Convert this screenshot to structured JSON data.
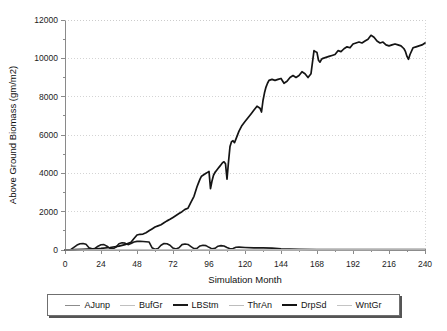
{
  "chart_data": {
    "type": "line",
    "title": "",
    "xlabel": "Simulation Month",
    "ylabel": "Above Ground Biomass (gm/m2)",
    "xlim": [
      0,
      240
    ],
    "ylim": [
      0,
      12000
    ],
    "xticks": [
      0,
      24,
      48,
      72,
      96,
      120,
      144,
      168,
      192,
      216,
      240
    ],
    "xtick_labels": [
      "0",
      "24",
      "48",
      "72",
      "96",
      "120",
      "144",
      "168",
      "192",
      "216",
      "240"
    ],
    "yticks": [
      0,
      2000,
      4000,
      6000,
      8000,
      10000,
      12000
    ],
    "ytick_labels": [
      "0",
      "2000",
      "4000",
      "6000",
      "8000",
      "10000",
      "12000"
    ],
    "yminor_ticks": [
      1000,
      3000,
      5000,
      7000,
      9000,
      11000
    ],
    "grid": "horizontal-dotted",
    "legend_position": "below-outside",
    "series": [
      {
        "name": "AJunp",
        "color": "#8c8c8c",
        "width": 1,
        "x": [
          0,
          6,
          12,
          18,
          24,
          30,
          36,
          42,
          48,
          54,
          60,
          66,
          72,
          78,
          84,
          90,
          96,
          102,
          108,
          114,
          120,
          126,
          132,
          138,
          144,
          150,
          156,
          162,
          168,
          174,
          180,
          186,
          192,
          198,
          204,
          210,
          216,
          222,
          228,
          234,
          240
        ],
        "values": [
          0,
          10,
          20,
          25,
          20,
          15,
          20,
          25,
          30,
          25,
          20,
          20,
          25,
          25,
          20,
          20,
          25,
          20,
          20,
          20,
          20,
          20,
          15,
          15,
          15,
          15,
          15,
          15,
          15,
          15,
          15,
          15,
          15,
          15,
          15,
          15,
          15,
          15,
          15,
          15,
          15
        ]
      },
      {
        "name": "BufGr",
        "color": "#c0c0c0",
        "width": 1,
        "x": [
          0,
          12,
          24,
          36,
          48,
          60,
          72,
          84,
          96,
          108,
          120,
          132,
          144,
          156,
          168,
          180,
          192,
          204,
          216,
          228,
          240
        ],
        "values": [
          0,
          15,
          25,
          20,
          25,
          20,
          20,
          20,
          20,
          15,
          15,
          15,
          10,
          10,
          10,
          10,
          10,
          10,
          10,
          10,
          10
        ]
      },
      {
        "name": "LBStm",
        "color": "#1a1a1a",
        "width": 1.6,
        "x": [
          0,
          4,
          8,
          10,
          12,
          14,
          16,
          18,
          20,
          22,
          24,
          26,
          28,
          30,
          32,
          34,
          36,
          38,
          40,
          42,
          44,
          46,
          48,
          50,
          52,
          54,
          56,
          58,
          60,
          62,
          64,
          66,
          68,
          70,
          72,
          74,
          76,
          78,
          80,
          82,
          84,
          86,
          88,
          90,
          92,
          94,
          96,
          98,
          100,
          102,
          104,
          106,
          108,
          110,
          112,
          114,
          116,
          120,
          126,
          132,
          138,
          144,
          156,
          168,
          180,
          192,
          204,
          216,
          228,
          240
        ],
        "values": [
          0,
          30,
          260,
          330,
          340,
          300,
          120,
          60,
          80,
          200,
          270,
          280,
          200,
          90,
          60,
          150,
          330,
          380,
          360,
          280,
          340,
          420,
          450,
          450,
          440,
          430,
          420,
          120,
          40,
          80,
          250,
          340,
          330,
          250,
          100,
          50,
          120,
          280,
          310,
          290,
          180,
          70,
          90,
          210,
          250,
          230,
          140,
          60,
          90,
          200,
          230,
          210,
          130,
          60,
          80,
          140,
          150,
          130,
          110,
          110,
          100,
          60,
          40,
          30,
          25,
          25,
          25,
          20,
          20,
          20
        ]
      },
      {
        "name": "ThrAn",
        "color": "#bdbdbd",
        "width": 1,
        "x": [
          0,
          12,
          24,
          36,
          48,
          60,
          72,
          84,
          96,
          108,
          120,
          132,
          144,
          156,
          168,
          180,
          192,
          204,
          216,
          228,
          240
        ],
        "values": [
          0,
          20,
          20,
          20,
          20,
          20,
          20,
          15,
          15,
          15,
          10,
          10,
          10,
          10,
          10,
          10,
          10,
          10,
          10,
          10,
          10
        ]
      },
      {
        "name": "DrpSd",
        "color": "#141414",
        "width": 1.7,
        "x": [
          0,
          6,
          12,
          18,
          24,
          30,
          36,
          40,
          44,
          46,
          48,
          50,
          52,
          54,
          56,
          58,
          60,
          62,
          64,
          66,
          68,
          70,
          72,
          74,
          76,
          78,
          80,
          82,
          84,
          86,
          88,
          89,
          90,
          91,
          92,
          93,
          94,
          95,
          96,
          97,
          98,
          99,
          100,
          101,
          102,
          103,
          104,
          105,
          106,
          107,
          108,
          109,
          110,
          111,
          112,
          113,
          114,
          116,
          118,
          120,
          122,
          124,
          126,
          128,
          130,
          131,
          132,
          133,
          134,
          135,
          136,
          138,
          140,
          142,
          144,
          146,
          148,
          150,
          152,
          154,
          156,
          158,
          160,
          162,
          164,
          165,
          166,
          167,
          168,
          169,
          170,
          171,
          172,
          174,
          176,
          178,
          180,
          182,
          184,
          186,
          188,
          190,
          192,
          194,
          196,
          198,
          200,
          202,
          204,
          206,
          208,
          210,
          212,
          214,
          216,
          218,
          220,
          222,
          224,
          226,
          227,
          228,
          229,
          230,
          232,
          234,
          236,
          238,
          240
        ],
        "values": [
          0,
          20,
          40,
          60,
          90,
          130,
          200,
          280,
          400,
          600,
          780,
          820,
          830,
          900,
          1000,
          1100,
          1200,
          1260,
          1320,
          1420,
          1520,
          1600,
          1700,
          1800,
          1900,
          2000,
          2120,
          2180,
          2500,
          2800,
          3300,
          3500,
          3700,
          3850,
          3900,
          3950,
          4000,
          4050,
          4100,
          3200,
          3600,
          3900,
          4050,
          4150,
          4250,
          4350,
          4450,
          4550,
          4600,
          4500,
          3700,
          4600,
          5400,
          5650,
          5700,
          5600,
          5800,
          6200,
          6500,
          6700,
          6900,
          7100,
          7300,
          7500,
          7400,
          7200,
          7800,
          8200,
          8500,
          8700,
          8850,
          8900,
          8850,
          8900,
          8950,
          8700,
          8800,
          9000,
          9100,
          9000,
          9100,
          9300,
          9200,
          9000,
          9200,
          9800,
          10400,
          10350,
          10300,
          9900,
          9800,
          9950,
          10000,
          10050,
          10100,
          10150,
          10200,
          10400,
          10350,
          10500,
          10600,
          10550,
          10750,
          10800,
          10850,
          10800,
          10900,
          11000,
          11200,
          11100,
          10900,
          10800,
          10850,
          10700,
          10650,
          10700,
          10750,
          10700,
          10650,
          10500,
          10350,
          10100,
          9950,
          10200,
          10550,
          10600,
          10650,
          10700,
          10800
        ]
      },
      {
        "name": "WntGr",
        "color": "#c4c4c4",
        "width": 1,
        "x": [
          0,
          12,
          24,
          36,
          48,
          60,
          72,
          84,
          96,
          108,
          120,
          132,
          144,
          156,
          168,
          180,
          192,
          204,
          216,
          228,
          240
        ],
        "values": [
          0,
          10,
          15,
          15,
          15,
          15,
          15,
          10,
          10,
          10,
          10,
          10,
          10,
          10,
          10,
          10,
          10,
          10,
          10,
          10,
          10
        ]
      }
    ]
  },
  "legend": {
    "items": [
      {
        "label": "AJunp",
        "color": "#8c8c8c",
        "width": 1
      },
      {
        "label": "BufGr",
        "color": "#c0c0c0",
        "width": 1
      },
      {
        "label": "LBStm",
        "color": "#1a1a1a",
        "width": 2
      },
      {
        "label": "ThrAn",
        "color": "#bdbdbd",
        "width": 1
      },
      {
        "label": "DrpSd",
        "color": "#141414",
        "width": 2
      },
      {
        "label": "WntGr",
        "color": "#c4c4c4",
        "width": 1
      }
    ]
  }
}
